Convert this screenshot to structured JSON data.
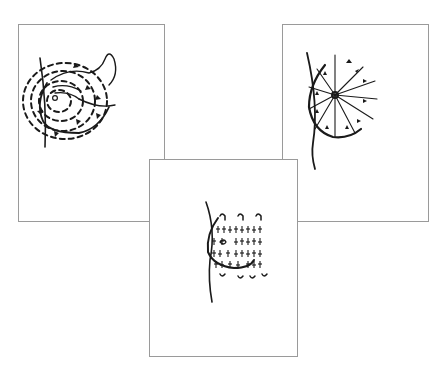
{
  "figure": {
    "panels": [
      {
        "id": "circular",
        "label": "Circular (spiral) pattern",
        "position": "top-left"
      },
      {
        "id": "wedge",
        "label": "Wedge (radial spoke) pattern",
        "position": "top-right"
      },
      {
        "id": "vertical-strip",
        "label": "Vertical strip (up-and-down) pattern",
        "position": "bottom-center"
      }
    ]
  },
  "colors": {
    "ink": "#1a1a1a",
    "frame": "#9a9a9a",
    "background": "#ffffff"
  }
}
